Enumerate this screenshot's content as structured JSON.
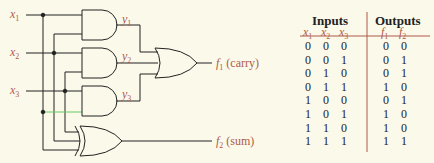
{
  "circuit": {
    "inputs": [
      "x1",
      "x2",
      "x3"
    ],
    "intermediates": [
      "y1",
      "y2",
      "y3"
    ],
    "outputs": [
      {
        "name": "f1",
        "desc": "(carry)"
      },
      {
        "name": "f2",
        "desc": "(sum)"
      }
    ],
    "wire_color": "#222222",
    "label_color": "#b05a4a"
  },
  "table": {
    "groups": [
      {
        "label": "Inputs"
      },
      {
        "label": "Outputs"
      }
    ],
    "columns": [
      "x1",
      "x2",
      "x3",
      "f1",
      "f2"
    ],
    "rows": [
      [
        0,
        0,
        0,
        0,
        0
      ],
      [
        0,
        0,
        1,
        0,
        1
      ],
      [
        0,
        1,
        0,
        0,
        1
      ],
      [
        0,
        1,
        1,
        1,
        0
      ],
      [
        1,
        0,
        0,
        0,
        1
      ],
      [
        1,
        0,
        1,
        1,
        0
      ],
      [
        1,
        1,
        0,
        1,
        0
      ],
      [
        1,
        1,
        1,
        1,
        1
      ]
    ]
  }
}
